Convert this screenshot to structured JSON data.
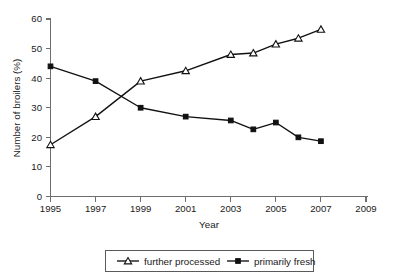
{
  "chart_data": {
    "type": "line",
    "title": "",
    "xlabel": "Year",
    "ylabel": "Number of broilers (%)",
    "xlim": [
      1995,
      2009
    ],
    "ylim": [
      0,
      60
    ],
    "xticks": [
      "1995",
      "1997",
      "1999",
      "2001",
      "2003",
      "2005",
      "2007",
      "2009"
    ],
    "yticks": [
      "0",
      "10",
      "20",
      "30",
      "40",
      "50",
      "60"
    ],
    "grid": false,
    "legend_position": "bottom-center",
    "x": [
      1995,
      1997,
      1999,
      2001,
      2003,
      2004,
      2005,
      2006,
      2007
    ],
    "series": [
      {
        "name": "further processed",
        "marker": "open-triangle",
        "color": "#111111",
        "values": [
          17.5,
          27.0,
          39.0,
          42.5,
          48.0,
          48.5,
          51.5,
          53.5,
          56.5
        ]
      },
      {
        "name": "primarily fresh",
        "marker": "filled-square",
        "color": "#111111",
        "values": [
          44.0,
          39.0,
          30.0,
          27.0,
          25.7,
          22.7,
          25.0,
          20.0,
          18.7
        ]
      }
    ]
  },
  "legend": {
    "items": [
      {
        "label": "further processed",
        "marker": "open-triangle"
      },
      {
        "label": "primarily fresh",
        "marker": "filled-square"
      }
    ]
  },
  "axis": {
    "x_title": "Year",
    "y_title": "Number of broilers (%)"
  }
}
